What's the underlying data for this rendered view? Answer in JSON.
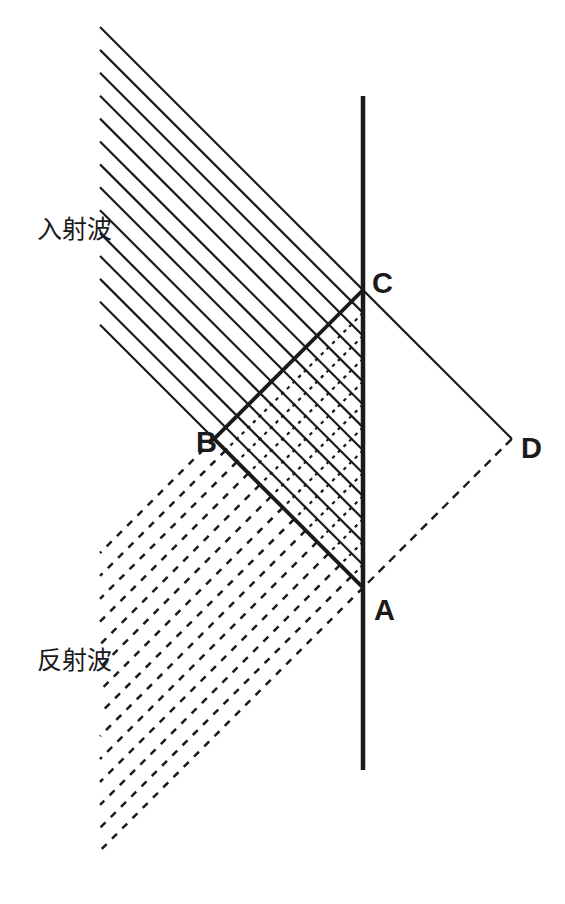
{
  "canvas": {
    "width": 565,
    "height": 904,
    "background": "#ffffff",
    "ink": "#1a1a1a"
  },
  "wall": {
    "x": 363,
    "y_top": 96,
    "y_bottom": 770,
    "stroke_width": 4.5
  },
  "waves": {
    "count": 14,
    "left_x": 100,
    "first_wall_y": 290,
    "wall_spacing": 22.9,
    "thin_width": 2.2,
    "thick_width": 3.8,
    "fine_dash": "3.5 4.5",
    "fine_dash_width": 2.2,
    "long_dash": "7 7.5",
    "long_dash_width": 2.5
  },
  "construction": {
    "ad_dash": "8.5 6.5",
    "ad_width": 2.4
  },
  "labels": {
    "incident": {
      "text": "入射波",
      "x": 37,
      "y": 238
    },
    "reflected": {
      "text": "反射波",
      "x": 37,
      "y": 669
    }
  },
  "points": {
    "C": {
      "text": "C",
      "x": 372,
      "y": 293
    },
    "B": {
      "text": "B",
      "x": 196,
      "y": 452
    },
    "A": {
      "text": "A",
      "x": 374,
      "y": 620
    },
    "D": {
      "text": "D",
      "x": 521,
      "y": 458
    }
  }
}
